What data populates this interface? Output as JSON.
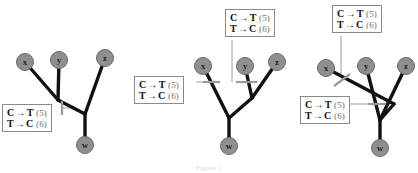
{
  "figure": {
    "caption": "Figure 1",
    "background_color": "#ffffff",
    "node_fill_color": "#8f8f8f",
    "node_stroke_color": "#6b6b6b",
    "branch_color": "#111111",
    "tick_color": "#9a9a9a",
    "leader_color": "#9a9a9a",
    "box_border_color": "#8a8a8a"
  },
  "mutation_label": {
    "line1": {
      "from": "C",
      "arrow": "→",
      "to": "T",
      "count": "(5)"
    },
    "line2": {
      "from": "T",
      "arrow": "→",
      "to": "C",
      "count": "(6)"
    }
  },
  "trees": [
    {
      "id": "tree-1",
      "name": "tree-left",
      "taxa": [
        {
          "id": "x",
          "label": "x",
          "cx": 25,
          "cy": 62
        },
        {
          "id": "y",
          "label": "y",
          "cx": 59,
          "cy": 60
        },
        {
          "id": "z",
          "label": "z",
          "cx": 105,
          "cy": 58
        },
        {
          "id": "w",
          "label": "w",
          "cx": 85,
          "cy": 145
        }
      ],
      "internal_nodes": [
        {
          "id": "n1",
          "cx": 58,
          "cy": 100
        },
        {
          "id": "n2",
          "cx": 85,
          "cy": 114
        }
      ],
      "branches": [
        {
          "from": "x",
          "to": "n1"
        },
        {
          "from": "y",
          "to": "n1"
        },
        {
          "from": "n1",
          "to": "n2"
        },
        {
          "from": "z",
          "to": "n2"
        },
        {
          "from": "n2",
          "to": "w"
        }
      ],
      "labels": [
        {
          "id": "tree1-label-1",
          "box_x": 2,
          "box_y": 104,
          "leader": {
            "x1": 62,
            "y1": 108,
            "x2": 75,
            "y2": 108
          },
          "tick": {
            "x1": 62,
            "y1": 101,
            "x2": 62,
            "y2": 115
          }
        }
      ]
    },
    {
      "id": "tree-2",
      "name": "tree-middle",
      "offset_x": 140,
      "taxa": [
        {
          "id": "x",
          "label": "x",
          "cx": 63,
          "cy": 66
        },
        {
          "id": "y",
          "label": "y",
          "cx": 105,
          "cy": 66
        },
        {
          "id": "z",
          "label": "z",
          "cx": 137,
          "cy": 62
        },
        {
          "id": "w",
          "label": "w",
          "cx": 89,
          "cy": 146
        }
      ],
      "internal_nodes": [
        {
          "id": "n1",
          "cx": 89,
          "cy": 118
        },
        {
          "id": "n2",
          "cx": 112,
          "cy": 98
        }
      ],
      "branches": [
        {
          "from": "x",
          "to": "n1"
        },
        {
          "from": "n1",
          "to": "n2"
        },
        {
          "from": "y",
          "to": "n2"
        },
        {
          "from": "z",
          "to": "n2"
        },
        {
          "from": "n1",
          "to": "w"
        }
      ],
      "labels": [
        {
          "id": "tree2-label-1",
          "box_x": -6,
          "box_y": 76,
          "leader": {
            "x1": 56,
            "y1": 82,
            "x2": 76,
            "y2": 82
          },
          "tick": {
            "x1": 63,
            "y1": 82,
            "x2": 80,
            "y2": 82
          }
        },
        {
          "id": "tree2-label-2",
          "box_x": 85,
          "box_y": 9,
          "leader": {
            "x1": 92,
            "y1": 40,
            "x2": 92,
            "y2": 82
          },
          "tick": {
            "x1": 96,
            "y1": 82,
            "x2": 117,
            "y2": 82
          }
        }
      ]
    },
    {
      "id": "tree-3",
      "name": "tree-right",
      "offset_x": 290,
      "taxa": [
        {
          "id": "x",
          "label": "x",
          "cx": 36,
          "cy": 68
        },
        {
          "id": "y",
          "label": "y",
          "cx": 76,
          "cy": 66
        },
        {
          "id": "z",
          "label": "z",
          "cx": 116,
          "cy": 66
        },
        {
          "id": "w",
          "label": "w",
          "cx": 90,
          "cy": 148
        }
      ],
      "internal_nodes": [
        {
          "id": "n1",
          "cx": 90,
          "cy": 120
        },
        {
          "id": "n2",
          "cx": 104,
          "cy": 104
        }
      ],
      "branches": [
        {
          "from": "x",
          "to": "n2"
        },
        {
          "from": "y",
          "to": "n1"
        },
        {
          "from": "z",
          "to": "n1"
        },
        {
          "from": "n2",
          "to": "n1"
        },
        {
          "from": "n1",
          "to": "w"
        }
      ],
      "labels": [
        {
          "id": "tree3-label-1",
          "box_x": 42,
          "box_y": 5,
          "leader": {
            "x1": 51,
            "y1": 36,
            "x2": 51,
            "y2": 78
          },
          "tick": {
            "x1": 44,
            "y1": 86,
            "x2": 60,
            "y2": 74
          }
        },
        {
          "id": "tree3-label-2",
          "box_x": 10,
          "box_y": 96,
          "leader": {
            "x1": 58,
            "y1": 104,
            "x2": 84,
            "y2": 104
          },
          "tick": {
            "x1": 78,
            "y1": 104,
            "x2": 96,
            "y2": 104
          }
        }
      ]
    }
  ]
}
